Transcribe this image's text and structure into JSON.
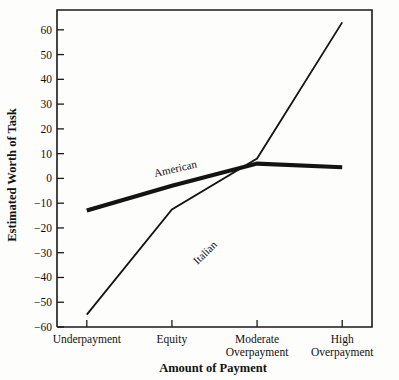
{
  "chart_data": {
    "type": "line",
    "title": "",
    "xlabel": "Amount of Payment",
    "ylabel": "Estimated Worth of Task",
    "categories": [
      "Underpayment",
      "Equity",
      "Moderate Overpayment",
      "High Overpayment"
    ],
    "category_lines": [
      [
        "Underpayment"
      ],
      [
        "Equity"
      ],
      [
        "Moderate",
        "Overpayment"
      ],
      [
        "High",
        "Overpayment"
      ]
    ],
    "ylim": [
      -60,
      68
    ],
    "yticks": [
      -60,
      -50,
      -40,
      -30,
      -20,
      -10,
      0,
      10,
      20,
      30,
      40,
      50,
      60
    ],
    "ytick_labels": [
      "−60",
      "−50",
      "−40",
      "−30",
      "−20",
      "−10",
      "0",
      "10",
      "20",
      "30",
      "40",
      "50",
      "60"
    ],
    "grid": false,
    "legend_position": "inline-annotation",
    "series": [
      {
        "name": "American",
        "values": [
          -13,
          -3,
          6,
          4.5
        ],
        "stroke_width": 4.2,
        "label": "American",
        "label_x": 1.05,
        "label_y": 2.5,
        "label_rotation": -13
      },
      {
        "name": "Italian",
        "values": [
          -55,
          -12.5,
          8,
          63
        ],
        "stroke_width": 1.8,
        "label": "Italian",
        "label_x": 1.42,
        "label_y": -31,
        "label_rotation": -44
      }
    ]
  },
  "axes": {
    "y_axis_title": "Estimated Worth of Task",
    "x_axis_title": "Amount of Payment"
  }
}
